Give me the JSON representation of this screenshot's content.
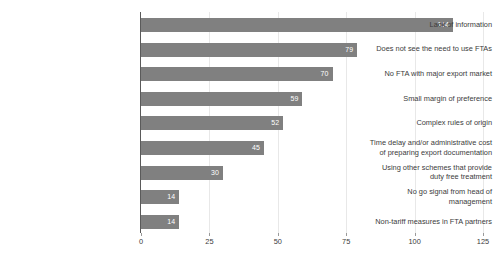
{
  "chart_data": {
    "type": "bar",
    "orientation": "horizontal",
    "title": "",
    "subtitle": "",
    "xlabel": "",
    "ylabel": "",
    "xlim": [
      0,
      125
    ],
    "xticks": [
      0,
      25,
      50,
      75,
      100,
      125
    ],
    "xtick_labels": [
      "0",
      "25",
      "50",
      "75",
      "100",
      "125"
    ],
    "grid": "vertical",
    "legend": "none",
    "bar_color": "#808080",
    "value_label_color": "#ffffff",
    "axis_line_color": "#5a5a5a",
    "gridline_color": "#e8e8e8",
    "text_color": "#3b3b3b",
    "categories": [
      "Lack of information",
      "Does not see the need to use FTAs",
      "No FTA with major export market",
      "Small margin of preference",
      "Complex rules of origin",
      "Time delay and/or administrative cost\nof preparing export documentation",
      "Using other schemes that provide\nduty free treatment",
      "No go signal from head of\nmanagement",
      "Non-tariff measures in FTA partners"
    ],
    "values": [
      114,
      79,
      70,
      59,
      52,
      45,
      30,
      14,
      14
    ],
    "value_labels": [
      "114",
      "79",
      "70",
      "59",
      "52",
      "45",
      "30",
      "14",
      "14"
    ]
  }
}
